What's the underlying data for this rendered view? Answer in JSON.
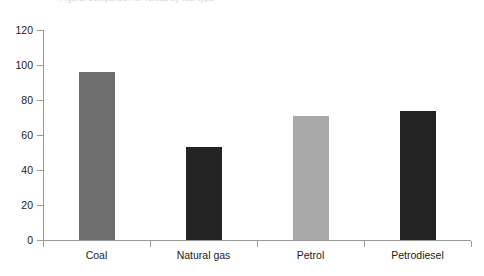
{
  "chart_data": {
    "type": "bar",
    "title": "",
    "xlabel": "",
    "ylabel": "",
    "ylim": [
      0,
      120
    ],
    "grid": false,
    "legend": null,
    "categories": [
      "Coal",
      "Natural gas",
      "Petrol",
      "Petrodiesel"
    ],
    "values": [
      96,
      53,
      71,
      74
    ],
    "bar_colors": [
      "#6e6e6e",
      "#232323",
      "#a8a8a8",
      "#232323"
    ],
    "ytick_labels": [
      "0",
      "20",
      "40",
      "60",
      "80",
      "100",
      "120"
    ],
    "ytick_values": [
      0,
      20,
      40,
      60,
      80,
      100,
      120
    ]
  },
  "figure": {
    "background": "#ffffff",
    "axis_color": "#9a9a9a",
    "text_color": "#1a1a1a",
    "clipped_title": "Figure: comparison of values by fuel type"
  }
}
